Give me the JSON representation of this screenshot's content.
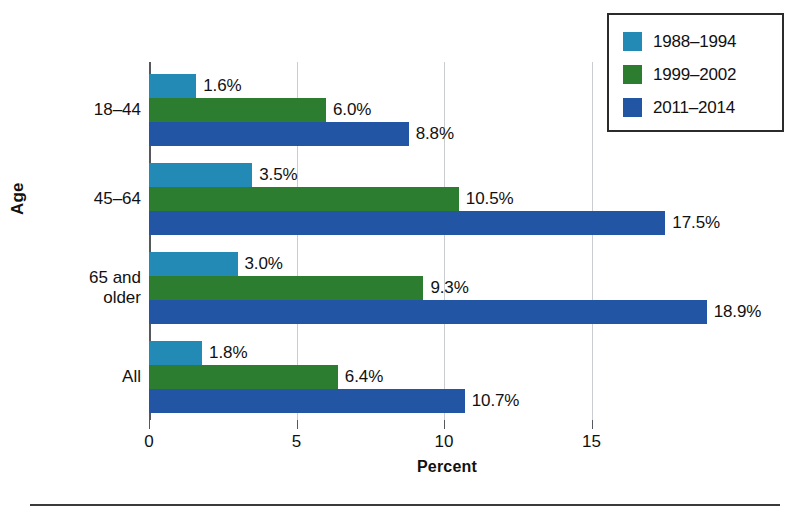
{
  "chart_data": {
    "type": "bar",
    "orientation": "horizontal",
    "title": "",
    "xlabel": "Percent",
    "ylabel": "Age",
    "categories": [
      "18–44",
      "45–64",
      "65 and\nolder",
      "All"
    ],
    "series": [
      {
        "name": "1988–1994",
        "color": "#2389b5",
        "values": [
          1.6,
          3.5,
          3.0,
          1.8
        ],
        "labels": [
          "1.6%",
          "3.5%",
          "3.0%",
          "1.8%"
        ]
      },
      {
        "name": "1999–2002",
        "color": "#2c7d30",
        "values": [
          6.0,
          10.5,
          9.3,
          6.4
        ],
        "labels": [
          "6.0%",
          "10.5%",
          "9.3%",
          "6.4%"
        ]
      },
      {
        "name": "2011–2014",
        "color": "#2255a4",
        "values": [
          8.8,
          17.5,
          18.9,
          10.7
        ],
        "labels": [
          "8.8%",
          "17.5%",
          "18.9%",
          "10.7%"
        ]
      }
    ],
    "xlim": [
      0,
      20.2
    ],
    "xticks": [
      0,
      5,
      10,
      15
    ],
    "xticklabels": [
      "0",
      "5",
      "10",
      "15"
    ],
    "grid": "vertical",
    "legend_position": "top-right"
  },
  "legend": {
    "items": [
      {
        "label": "1988–1994",
        "color": "#2389b5"
      },
      {
        "label": "1999–2002",
        "color": "#2c7d30"
      },
      {
        "label": "2011–2014",
        "color": "#2255a4"
      }
    ]
  },
  "axis": {
    "y_title": "Age",
    "x_title": "Percent",
    "y_categories": [
      "18–44",
      "45–64",
      "65 and\nolder",
      "All"
    ],
    "x_tick_labels": [
      "0",
      "5",
      "10",
      "15"
    ]
  }
}
